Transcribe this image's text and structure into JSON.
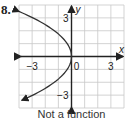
{
  "problem_number": "8.",
  "caption": "Not a function",
  "chart_data": {
    "type": "line",
    "title": "",
    "xlabel": "x",
    "ylabel": "y",
    "xlim": [
      -4,
      4
    ],
    "ylim": [
      -4,
      4
    ],
    "grid": true,
    "x_tick_labels": [
      {
        "value": -3,
        "label": "−3"
      },
      {
        "value": 0,
        "label": "0"
      },
      {
        "value": 3,
        "label": "3"
      }
    ],
    "y_tick_labels": [
      {
        "value": 3,
        "label": "3"
      },
      {
        "value": -3,
        "label": "−3"
      }
    ],
    "series": [
      {
        "name": "relation",
        "equation": "x = -y^2/3",
        "points": [
          [
            -4,
            3.5
          ],
          [
            -3,
            3
          ],
          [
            -1.33,
            2
          ],
          [
            -0.33,
            1
          ],
          [
            0,
            0
          ],
          [
            -0.33,
            -1
          ],
          [
            -1.33,
            -2
          ],
          [
            -3,
            -3
          ],
          [
            -4,
            -3.5
          ]
        ],
        "arrows_at_ends": true
      }
    ],
    "colors": {
      "grid": "#c8c8c8",
      "axis": "#222222",
      "curve": "#333333"
    }
  }
}
